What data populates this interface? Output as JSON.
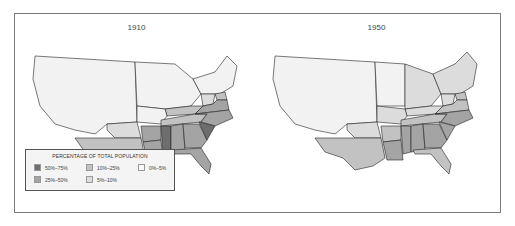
{
  "maps": [
    {
      "title": "1910",
      "regions": {
        "west": "0%–5%",
        "midwest": "0%–5%",
        "northeast": "0%–5%",
        "texas": "10%–25%",
        "oklahoma": "5%–10%",
        "arkansas": "25%–50%",
        "louisiana": "25%–50%",
        "mississippi": "50%–75%",
        "alabama": "25%–50%",
        "georgia": "25%–50%",
        "florida": "25%–50%",
        "south_carolina": "50%–75%",
        "north_carolina": "25%–50%",
        "virginia": "25%–50%",
        "tennessee": "10%–25%",
        "kentucky": "10%–25%",
        "west_virginia": "5%–10%",
        "missouri": "0%–5%",
        "maryland_delaware": "10%–25%"
      }
    },
    {
      "title": "1950",
      "regions": {
        "west": "0%–5%",
        "midwest": "0%–5%",
        "michigan_ohio_indiana_illinois": "5%–10%",
        "northeast": "5%–10%",
        "texas": "10%–25%",
        "oklahoma": "5%–10%",
        "missouri": "5%–10%",
        "arkansas": "10%–25%",
        "louisiana": "25%–50%",
        "mississippi": "25%–50%",
        "alabama": "25%–50%",
        "georgia": "25%–50%",
        "florida": "10%–25%",
        "south_carolina": "25%–50%",
        "north_carolina": "25%–50%",
        "virginia": "10%–25%",
        "tennessee": "10%–25%",
        "kentucky": "5%–10%",
        "west_virginia": "5%–10%",
        "maryland_delaware": "10%–25%"
      }
    }
  ],
  "legend": {
    "title": "PERCENTAGE OF TOTAL POPULATION",
    "items": [
      {
        "label": "50%–75%",
        "color": "#6e6e6e"
      },
      {
        "label": "25%–50%",
        "color": "#a4a4a4"
      },
      {
        "label": "10%–25%",
        "color": "#c2c2c2"
      },
      {
        "label": "5%–10%",
        "color": "#dcdcdc"
      },
      {
        "label": "0%–5%",
        "color": "#f4f4f4"
      }
    ]
  }
}
